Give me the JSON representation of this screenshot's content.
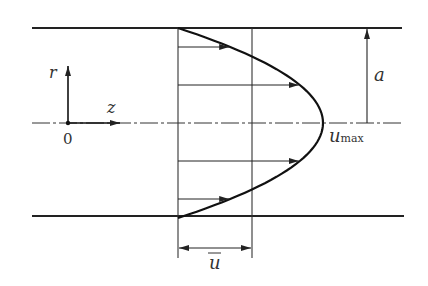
{
  "colors": {
    "line": "#222222",
    "text": "#333333",
    "background": "#ffffff"
  },
  "labels": {
    "r_axis": "r",
    "z_axis": "z",
    "origin": "0",
    "radius": "a",
    "u_max_main": "u",
    "u_max_sub": "max",
    "u_bar": "u"
  },
  "profile": {
    "type": "parabolic",
    "arrow_fractions_of_radius": [
      0.8,
      0.4,
      -0.4,
      -0.8
    ],
    "mean_to_max_ratio": 0.5
  }
}
